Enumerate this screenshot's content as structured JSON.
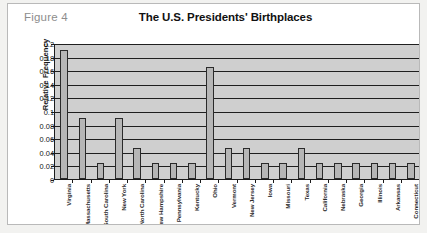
{
  "figure": {
    "caption": "Figure 4"
  },
  "chart_data": {
    "type": "bar",
    "title": "The U.S. Presidents' Birthplaces",
    "xlabel": "",
    "ylabel": "Relative Frequency",
    "ylim": [
      0,
      0.2
    ],
    "ytick_labels": [
      "0.2",
      "0.18",
      "0.16",
      "0.14",
      "0.12",
      "0.1",
      "0.08",
      "0.06",
      "0.04",
      "0.02",
      "0"
    ],
    "ytick_values": [
      0.2,
      0.18,
      0.16,
      0.14,
      0.12,
      0.1,
      0.08,
      0.06,
      0.04,
      0.02,
      0
    ],
    "grid": true,
    "legend": "none",
    "categories": [
      "Virginia",
      "Massachusetts",
      "South Carolina",
      "New York",
      "North Carolina",
      "New Hampshire",
      "Pennsylvania",
      "Kentucky",
      "Ohio",
      "Vermont",
      "New Jersey",
      "Iowa",
      "Missouri",
      "Texas",
      "California",
      "Nebraska",
      "Georgia",
      "Illinois",
      "Arkansas",
      "Connecticut"
    ],
    "values": [
      0.19,
      0.09,
      0.023,
      0.09,
      0.045,
      0.023,
      0.023,
      0.023,
      0.165,
      0.045,
      0.045,
      0.023,
      0.023,
      0.045,
      0.023,
      0.023,
      0.023,
      0.023,
      0.023,
      0.023
    ]
  },
  "colors": {
    "bar_fill": "#b6b6b6",
    "bar_border": "#2a2a2a",
    "plot_background": "#cfcfcf",
    "gridline": "#1f1f1f",
    "axis": "#1b1b1b",
    "caption_text": "#8d8d8d",
    "title_text": "#111111",
    "page_background": "#f2f2f0",
    "card_background": "#ffffff"
  }
}
